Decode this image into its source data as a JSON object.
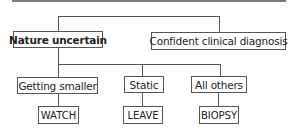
{
  "diagram": {
    "type": "decision-tree",
    "nodes": {
      "nature_uncertain": "Nature uncertain",
      "confident_diagnosis": "Confident clinical diagnosis",
      "getting_smaller": "Getting smaller",
      "static": "Static",
      "all_others": "All others",
      "watch": "WATCH",
      "leave": "LEAVE",
      "biopsy": "BIOPSY"
    },
    "edges": [
      [
        "root",
        "nature_uncertain"
      ],
      [
        "root",
        "confident_diagnosis"
      ],
      [
        "nature_uncertain",
        "getting_smaller"
      ],
      [
        "nature_uncertain",
        "static"
      ],
      [
        "nature_uncertain",
        "all_others"
      ],
      [
        "getting_smaller",
        "watch"
      ],
      [
        "static",
        "leave"
      ],
      [
        "all_others",
        "biopsy"
      ]
    ]
  }
}
